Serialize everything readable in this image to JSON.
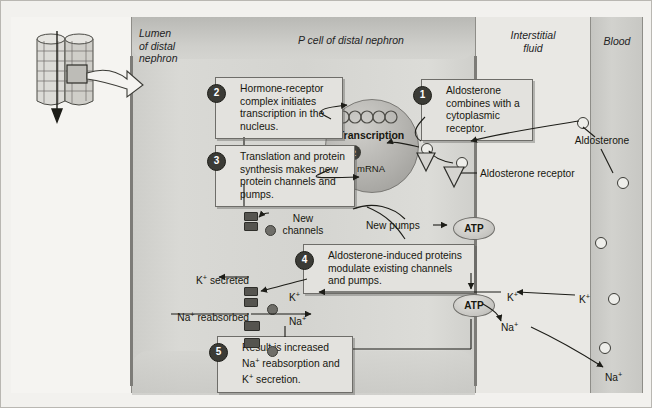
{
  "figure": {
    "background_color": "#f2f1ee"
  },
  "columns": [
    {
      "key": "lumen",
      "label": "Lumen\nof distal\nnephron",
      "label_lines": [
        "Lumen",
        "of distal",
        "nephron"
      ],
      "color": "#f5f4f1"
    },
    {
      "key": "p_cell",
      "label": "P cell of distal nephron",
      "color": "#d4d4d0"
    },
    {
      "key": "interstitial",
      "label": "Interstitial\nfluid",
      "label_lines": [
        "Interstitial",
        "fluid"
      ],
      "color": "#e9e8e4"
    },
    {
      "key": "blood",
      "label": "Blood",
      "color": "#c7c7c3"
    }
  ],
  "column_labels": {
    "lumen_line1": "Lumen",
    "lumen_line2": "of distal",
    "lumen_line3": "nephron",
    "p_cell": "P cell of distal nephron",
    "interstitial_line1": "Interstitial",
    "interstitial_line2": "fluid",
    "blood": "Blood"
  },
  "steps": [
    {
      "number": "1",
      "text": "Aldosterone combines with a cytoplasmic receptor."
    },
    {
      "number": "2",
      "text": "Hormone-receptor complex initiates transcription in the nucleus."
    },
    {
      "number": "3",
      "text": "Translation and protein synthesis makes new protein channels and pumps."
    },
    {
      "number": "4",
      "text": "Aldosterone-induced proteins modulate existing channels and pumps."
    },
    {
      "number": "5",
      "text": "Result is increased Na+ reabsorption and K+ secretion."
    }
  ],
  "nucleus": {
    "title": "Transcription",
    "step_number": "2",
    "product": "mRNA"
  },
  "labels": {
    "aldosterone_receptor": "Aldosterone receptor",
    "aldosterone_blood": "Aldosterone",
    "new_channels_line1": "New",
    "new_channels_line2": "channels",
    "new_pumps": "New pumps",
    "k_secreted": "K+ secreted",
    "na_reabsorbed": "Na+ reabsorbed",
    "k_cell": "K+",
    "na_cell": "Na+",
    "k_interstitial": "K+",
    "na_interstitial": "Na+",
    "k_blood": "K+",
    "na_blood": "Na+",
    "atp_top": "ATP",
    "atp_bottom": "ATP"
  },
  "icons": {
    "tubule_inset": "kidney-tubule-inset-icon",
    "magnify_arrow": "magnification-arrow-icon",
    "nucleus": "nucleus-icon",
    "receptor": "receptor-triangle-icon",
    "hormone": "hormone-circle-icon",
    "atp": "atp-oval-icon"
  },
  "colors": {
    "cell": "#d4d4d0",
    "blood": "#c7c7c3",
    "callout_bg": "#e3e2de",
    "outline": "#6e6d69",
    "step_badge": "#3b3b36",
    "membrane": "#7d7c78"
  }
}
